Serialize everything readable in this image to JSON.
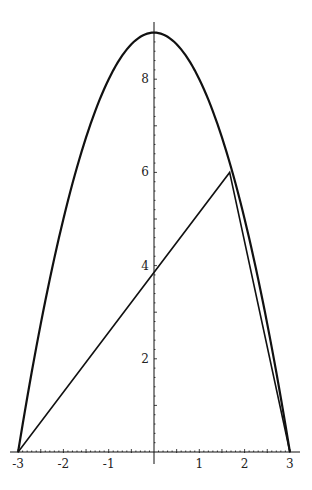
{
  "chart_data": {
    "type": "line",
    "title": "",
    "xlabel": "",
    "ylabel": "",
    "xlim": [
      -3,
      3
    ],
    "ylim": [
      0,
      9
    ],
    "grid": false,
    "legend": null,
    "x_ticks": [
      -3,
      -2,
      -1,
      1,
      2,
      3
    ],
    "x_tick_labels": [
      "-3",
      "-2",
      "-1",
      "1",
      "2",
      "3"
    ],
    "y_ticks": [
      2,
      4,
      6,
      8
    ],
    "y_tick_labels": [
      "2",
      "4",
      "6",
      "8"
    ],
    "series": [
      {
        "name": "parabola y = 9 - x^2",
        "kind": "curve",
        "x": [
          -3,
          -2.5,
          -2,
          -1.5,
          -1,
          -0.5,
          0,
          0.5,
          1,
          1.5,
          2,
          2.5,
          3
        ],
        "y": [
          0,
          2.75,
          5,
          6.75,
          8,
          8.75,
          9,
          8.75,
          8,
          6.75,
          5,
          2.75,
          0
        ]
      },
      {
        "name": "inscribed triangle",
        "kind": "polyline",
        "x": [
          -3,
          1.67,
          3
        ],
        "y": [
          0,
          6,
          0
        ]
      }
    ],
    "annotations": {
      "triangle_y_intercept": 3.86
    }
  },
  "colors": {
    "background": "#ffffff",
    "ink": "#111111"
  }
}
